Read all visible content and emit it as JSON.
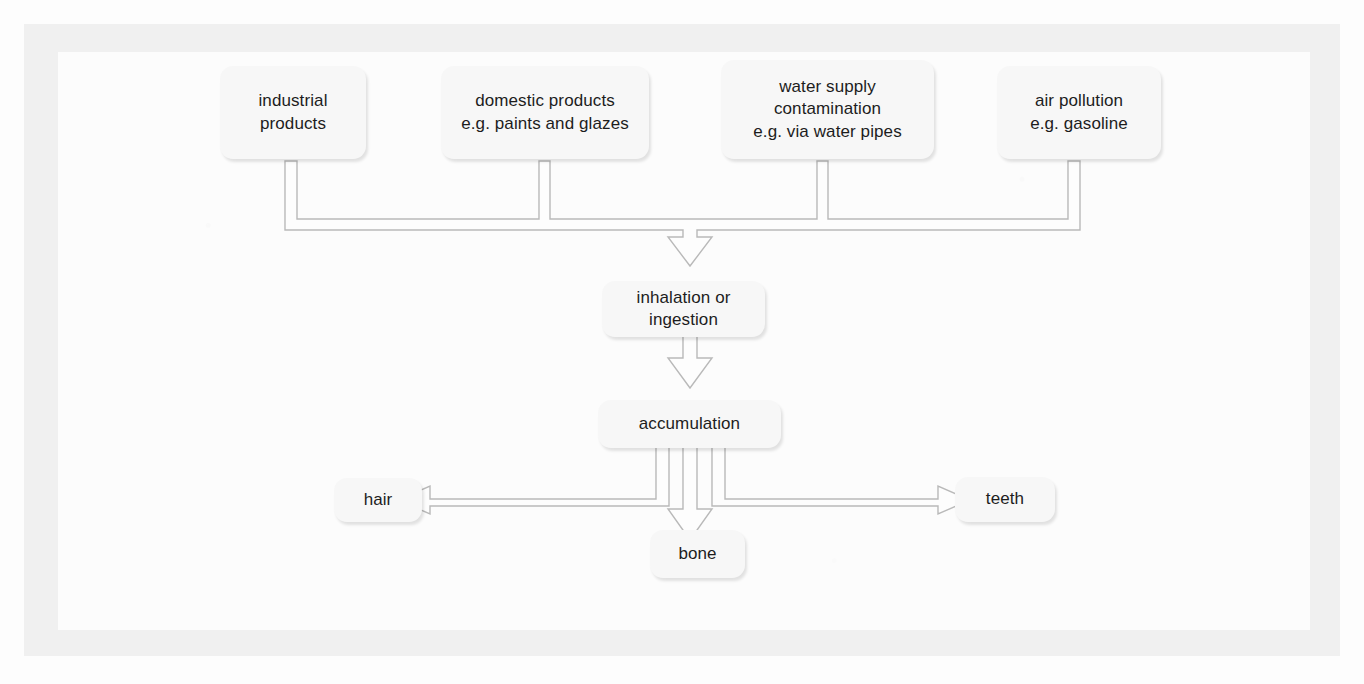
{
  "diagram": {
    "nodes": {
      "industrial_products": "industrial\nproducts",
      "domestic_products": "domestic products\ne.g. paints and glazes",
      "water_supply": "water supply\ncontamination\ne.g. via water pipes",
      "air_pollution": "air pollution\ne.g. gasoline",
      "inhalation_ingestion": "inhalation or\ningestion",
      "accumulation": "accumulation",
      "hair": "hair",
      "bone": "bone",
      "teeth": "teeth"
    },
    "connectors": [
      {
        "name": "sources-manifold-to-inhalation",
        "from": [
          "industrial products",
          "domestic products",
          "water supply contamination",
          "air pollution"
        ],
        "to": "inhalation or ingestion",
        "style": "hollow-block-arrow",
        "direction": "down"
      },
      {
        "name": "inhalation-to-accumulation",
        "from": "inhalation or ingestion",
        "to": "accumulation",
        "style": "hollow-block-arrow",
        "direction": "down"
      },
      {
        "name": "accumulation-to-hair",
        "from": "accumulation",
        "to": "hair",
        "style": "hollow-block-arrow",
        "direction": "left"
      },
      {
        "name": "accumulation-to-bone",
        "from": "accumulation",
        "to": "bone",
        "style": "hollow-block-arrow",
        "direction": "down"
      },
      {
        "name": "accumulation-to-teeth",
        "from": "accumulation",
        "to": "teeth",
        "style": "hollow-block-arrow",
        "direction": "right"
      }
    ],
    "colors": {
      "page_background": "#fdfdfd",
      "frame": "#f0f0f0",
      "panel": "#fcfcfc",
      "node_fill": "#f7f7f7",
      "connector_stroke": "#b9b9b9",
      "text": "#1d1d1d"
    }
  }
}
